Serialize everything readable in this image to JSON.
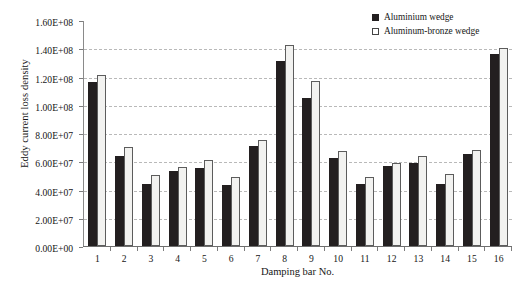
{
  "chart_data": {
    "type": "bar",
    "title": "",
    "xlabel": "Damping bar No.",
    "ylabel": "Eddy current loss density",
    "categories": [
      "1",
      "2",
      "3",
      "4",
      "5",
      "6",
      "7",
      "8",
      "9",
      "10",
      "11",
      "12",
      "13",
      "14",
      "15",
      "16"
    ],
    "ylim": [
      0,
      160000000
    ],
    "ytick_values": [
      0,
      20000000,
      40000000,
      60000000,
      80000000,
      100000000,
      120000000,
      140000000,
      160000000
    ],
    "ytick_labels": [
      "0.00E+00",
      "2.00E+07",
      "4.00E+07",
      "6.00E+07",
      "8.00E+07",
      "1.00E+08",
      "1.20E+08",
      "1.40E+08",
      "1.60E+08"
    ],
    "grid": true,
    "legend_position": "top-right",
    "series": [
      {
        "name": "Aluminium wedge",
        "color": "#231f20",
        "values": [
          116000000,
          64000000,
          44000000,
          53000000,
          55000000,
          43000000,
          71000000,
          131000000,
          105000000,
          62000000,
          44000000,
          57000000,
          59000000,
          44000000,
          65000000,
          136000000
        ]
      },
      {
        "name": "Aluminum-bronze wedge",
        "color": "#ffffff",
        "values": [
          121000000,
          70000000,
          50000000,
          56000000,
          61000000,
          49000000,
          75000000,
          142000000,
          117000000,
          67000000,
          49000000,
          59000000,
          64000000,
          51000000,
          68000000,
          140000000
        ]
      }
    ]
  },
  "legend": {
    "items": [
      {
        "label": "Aluminium wedge"
      },
      {
        "label": "Aluminum-bronze wedge"
      }
    ]
  }
}
